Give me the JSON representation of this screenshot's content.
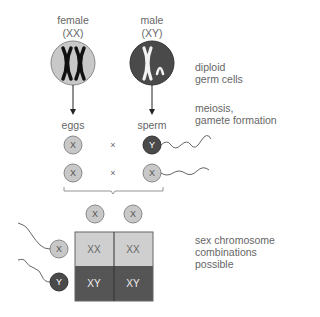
{
  "parents": {
    "female": {
      "label": "female",
      "genotype": "(XX)"
    },
    "male": {
      "label": "male",
      "genotype": "(XY)"
    }
  },
  "labels": {
    "diploid": [
      "diploid",
      "germ cells"
    ],
    "meiosis": [
      "meiosis,",
      "gamete formation"
    ],
    "combinations": [
      "sex chromosome",
      "combinations",
      "possible"
    ]
  },
  "gametes": {
    "eggs_label": "eggs",
    "sperm_label": "sperm",
    "row1": {
      "egg": "X",
      "cross": "×",
      "sperm": "Y"
    },
    "row2": {
      "egg": "X",
      "cross": "×",
      "sperm": "X"
    }
  },
  "punnett": {
    "top": [
      "X",
      "X"
    ],
    "side": [
      "X",
      "Y"
    ],
    "cells": [
      [
        "XX",
        "XX"
      ],
      [
        "XY",
        "XY"
      ]
    ]
  },
  "colors": {
    "light": "#c8c8c8",
    "dark": "#4a4a4a",
    "grid_light": "#cfcfcf",
    "grid_dark": "#555555"
  }
}
